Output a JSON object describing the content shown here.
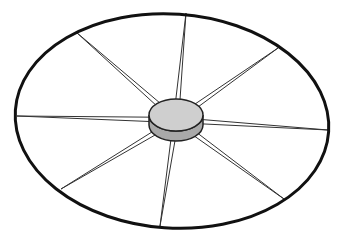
{
  "diagram": {
    "title": "",
    "colors": {
      "background": "#ffffff",
      "rim": "#111111",
      "spoke": "#333333",
      "hub_top": "#cfcfcf",
      "hub_side": "#a9a9a9",
      "hub_outline": "#222222"
    },
    "rim": {
      "cx": 172,
      "cy": 121,
      "rx": 157,
      "ry": 107,
      "rotate": 4,
      "stroke_width": 3
    },
    "hub": {
      "cx": 176,
      "cy": 115,
      "rx": 27,
      "ry": 16,
      "depth": 10
    },
    "spokes": [
      {
        "name": "top",
        "end": [
          186,
          13
        ]
      },
      {
        "name": "upper-right",
        "end": [
          278,
          48
        ]
      },
      {
        "name": "right",
        "end": [
          328,
          130
        ]
      },
      {
        "name": "lower-right",
        "end": [
          284,
          199
        ]
      },
      {
        "name": "bottom",
        "end": [
          160,
          226
        ]
      },
      {
        "name": "lower-left",
        "end": [
          61,
          189
        ]
      },
      {
        "name": "left",
        "end": [
          17,
          116
        ]
      },
      {
        "name": "upper-left",
        "end": [
          76,
          32
        ]
      }
    ]
  }
}
